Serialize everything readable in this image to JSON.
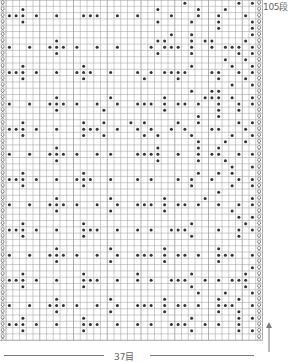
{
  "chart_title": "knitting chart",
  "labels": {
    "rows": "105段",
    "cols": "37目"
  },
  "grid": {
    "cols": 37,
    "rows": 54,
    "cell_w": 6.75,
    "cell_h": 6.3,
    "origin_x": 6,
    "origin_y": 0,
    "line_color": "#9a9a9a",
    "dot_color": "#333333",
    "marker": "twisted-knit-symbol"
  },
  "pattern": [
    "..........................o.......o.o",
    "..o...................o.....o...o....",
    "ooo.o..o...ooo..o..o....o...o..o...o.",
    "..o...................o....o...o....o.",
    "...............................o....o",
    "........................o..o........o",
    ".......o..............oo...o.oo....o.",
    "o..o..ooo.o..o..o....o.ooo.o..o.ooo.o",
    ".......o..............o....o......o.o",
    "................................o..o.",
    "..o........o...............o.....o..o",
    "ooo.o..o..ooo..o...o.o.oooo...oo..o.o",
    "..o........o........o....o.....o...o.",
    ".................................o..o",
    "...........................o..oo.....",
    ".......o.......o.......o.....ooo.o..o",
    "o..o..ooo.o..o..o..ooo.o.oo.o..o..o.o",
    ".......o......o........o.......o..o..",
    "............................o..o.....",
    "..o........o..o...o.o....o..o.....o.o",
    "ooo.o..o...ooo..o..o.o..o.o...oo...o.",
    "..o........o..o.....o.o....o.....o..o",
    "............................o...o..o.",
    ".......o..............o.....o..o.....",
    "o..o..ooo.o..o.o...oooo..o..o.oo..o.o",
    ".......o..............o.....o...o....",
    ".................................o..o",
    "..o........o................o..o.o...",
    "ooo.o..o..ooo..o...o.o...o.o..o...o.o",
    "..o........o...............o.....o..o",
    "...............................o.....",
    ".......o.......o.......o.....o......o",
    "o..o..ooo.o..o..o..ooo.o.oo.o..o..o.o",
    ".......o.......o.......o.........o...",
    "..................................o.o",
    "..o........o...............o.......o.",
    "ooo.o..o...ooo..o..o.o..ooo....o..o.o",
    "..o........o...............o......o..",
    ".....................................",
    ".......o.......o.......o.......o.....",
    "o..o..ooo.o..o..o..ooo.o.oo.o..ooo..o",
    ".......o.......o.......o.......o.....",
    "....................................o",
    "..o........o.......o.......o.......o.",
    "ooo.o..o...ooo..o..o.o..ooo..o.o.ooo.",
    "..o........o...............o.......o.",
    "............................o...o...o",
    ".......o.......o.......o.......o..o..",
    "o..o..ooo.o..o..o..ooo.o.oo.o..ooo..o",
    ".......o.......o.......o.......o..o..",
    "..o........o...............o......o.o",
    "ooo.o..o...ooo..o..o.o..ooo..o.o..o..",
    "..o........o...............o......o.o",
    "....................................."
  ]
}
